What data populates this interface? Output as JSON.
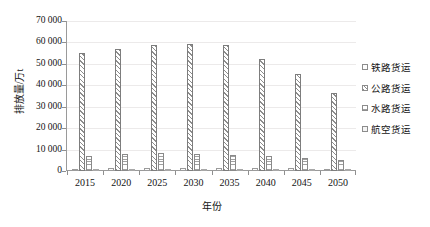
{
  "chart_data": {
    "type": "bar",
    "title": "",
    "xlabel": "年份",
    "ylabel": "排放量/万t",
    "categories": [
      "2015",
      "2020",
      "2025",
      "2030",
      "2035",
      "2040",
      "2045",
      "2050"
    ],
    "ylim": [
      0,
      70000
    ],
    "yticks": [
      "0",
      "10 000",
      "20 000",
      "30 000",
      "40 000",
      "50 000",
      "60 000",
      "70 000"
    ],
    "ytick_values": [
      0,
      10000,
      20000,
      30000,
      40000,
      50000,
      60000,
      70000
    ],
    "grid": true,
    "legend_position": "right",
    "series": [
      {
        "name": "铁路货运",
        "pattern": "plain-outline",
        "values": [
          1100,
          1250,
          1350,
          1400,
          1350,
          1300,
          1200,
          1150
        ]
      },
      {
        "name": "公路货运",
        "pattern": "diagonal-hatch",
        "values": [
          55300,
          56800,
          58900,
          59400,
          58700,
          52200,
          45500,
          36600
        ]
      },
      {
        "name": "水路货运",
        "pattern": "dotted-grid",
        "values": [
          6800,
          7900,
          8200,
          8100,
          7500,
          7000,
          6200,
          5200
        ]
      },
      {
        "name": "航空货运",
        "pattern": "light-fill",
        "values": [
          250,
          300,
          350,
          380,
          400,
          400,
          380,
          360
        ]
      }
    ]
  },
  "legend": {
    "items": [
      {
        "label": "铁路货运"
      },
      {
        "label": "公路货运"
      },
      {
        "label": "水路货运"
      },
      {
        "label": "航空货运"
      }
    ]
  },
  "colors": {
    "axis": "#9a9a9a",
    "grid": "#eceaea",
    "bar_outline": "#8c8c8c",
    "text": "#141414",
    "background": "#ffffff"
  }
}
